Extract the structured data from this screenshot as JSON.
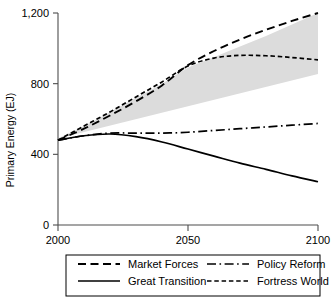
{
  "chart_data": {
    "type": "line",
    "title": "",
    "xlabel": "",
    "ylabel": "Primary Energy (EJ)",
    "xlim": [
      2000,
      2100
    ],
    "ylim": [
      0,
      1200
    ],
    "xticks": [
      2000,
      2050,
      2100
    ],
    "xtick_labels": [
      "2000",
      "2050",
      "2100"
    ],
    "yticks": [
      0,
      400,
      800,
      1200
    ],
    "ytick_labels": [
      "0",
      "400",
      "800",
      "1,200"
    ],
    "grid": false,
    "legend_position": "below-plot",
    "x": [
      2000,
      2010,
      2020,
      2030,
      2040,
      2050,
      2060,
      2070,
      2080,
      2090,
      2100
    ],
    "series": [
      {
        "name": "Market Forces",
        "style": "long-dash",
        "values": [
          480,
          545,
          620,
          700,
          790,
          905,
          985,
          1050,
          1105,
          1155,
          1200
        ]
      },
      {
        "name": "Policy Reform",
        "style": "dash-dot",
        "values": [
          480,
          505,
          520,
          520,
          520,
          525,
          535,
          545,
          555,
          565,
          575
        ]
      },
      {
        "name": "Great Transition",
        "style": "solid",
        "values": [
          480,
          505,
          515,
          500,
          470,
          430,
          390,
          350,
          315,
          278,
          245
        ]
      },
      {
        "name": "Fortress World",
        "style": "short-dash",
        "values": [
          480,
          560,
          640,
          725,
          810,
          900,
          945,
          960,
          958,
          948,
          935
        ]
      }
    ],
    "uncertainty_band": {
      "name": "scenario range",
      "color": "#dcdcdc",
      "upper": [
        490,
        560,
        640,
        720,
        800,
        890,
        950,
        1010,
        1070,
        1135,
        1200
      ],
      "lower": [
        455,
        470,
        490,
        515,
        545,
        580,
        625,
        675,
        730,
        790,
        855
      ]
    },
    "legend_entries": [
      {
        "label": "Market Forces",
        "style": "long-dash"
      },
      {
        "label": "Policy Reform",
        "style": "dash-dot"
      },
      {
        "label": "Great Transition",
        "style": "solid"
      },
      {
        "label": "Fortress World",
        "style": "short-dash"
      }
    ]
  }
}
